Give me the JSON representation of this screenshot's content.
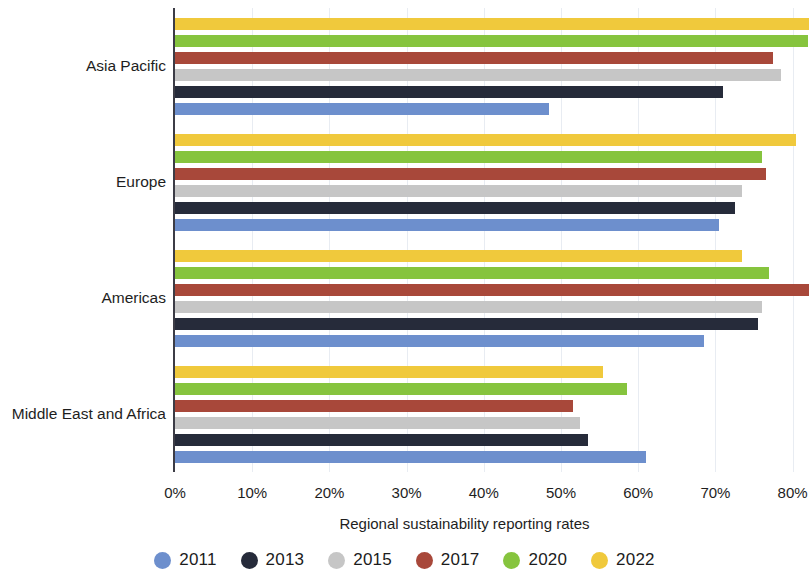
{
  "chart_data": {
    "type": "bar",
    "orientation": "horizontal",
    "title": "",
    "xlabel": "Regional sustainability reporting rates",
    "ylabel": "",
    "categories": [
      "Asia Pacific",
      "Europe",
      "Americas",
      "Middle East and Africa"
    ],
    "series": [
      {
        "name": "2011",
        "color": "#6d8fcd",
        "values": [
          48.5,
          70.5,
          68.5,
          61.0
        ]
      },
      {
        "name": "2013",
        "color": "#262b3a",
        "values": [
          71.0,
          72.5,
          75.5,
          53.5
        ]
      },
      {
        "name": "2015",
        "color": "#c6c6c6",
        "values": [
          78.5,
          73.5,
          76.0,
          52.5
        ]
      },
      {
        "name": "2017",
        "color": "#a8483a",
        "values": [
          77.5,
          76.5,
          82.5,
          51.5
        ]
      },
      {
        "name": "2020",
        "color": "#86c43e",
        "values": [
          82.0,
          76.0,
          77.0,
          58.5
        ]
      },
      {
        "name": "2022",
        "color": "#f0c93c",
        "values": [
          82.5,
          80.5,
          73.5,
          55.5
        ]
      }
    ],
    "xlim": [
      0,
      82.5
    ],
    "xticks": [
      0,
      10,
      20,
      30,
      40,
      50,
      60,
      70,
      80
    ],
    "xtick_labels": [
      "0%",
      "10%",
      "20%",
      "30%",
      "40%",
      "50%",
      "60%",
      "70%",
      "80%"
    ],
    "grid": true,
    "legend_position": "bottom"
  },
  "legend": {
    "items": [
      {
        "label": "2011",
        "color": "#6d8fcd"
      },
      {
        "label": "2013",
        "color": "#262b3a"
      },
      {
        "label": "2015",
        "color": "#c6c6c6"
      },
      {
        "label": "2017",
        "color": "#a8483a"
      },
      {
        "label": "2020",
        "color": "#86c43e"
      },
      {
        "label": "2022",
        "color": "#f0c93c"
      }
    ]
  }
}
